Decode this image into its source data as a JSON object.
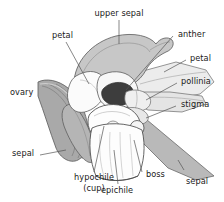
{
  "figure": {
    "kind": "botanical-diagram",
    "background_color": "#ffffff",
    "line_color": "#3a3a3a",
    "leader_line_color": "#555555",
    "text_color": "#1a1a1a",
    "fill_colors": {
      "upper_sepal": "#c9c9c9",
      "lateral_sepal": "#b8b8b8",
      "ovary": "#a8a8a8",
      "ovary_dark": "#949494",
      "petal_light": "#ececec",
      "column_white": "#fbfbfb",
      "anther_dark": "#3d3d3d",
      "lip_white": "#fdfdfd",
      "mid_gray": "#d4d4d4"
    }
  },
  "labels": {
    "upper_sepal": "upper sepal",
    "petal_left": "petal",
    "anther": "anther",
    "petal_right": "petal",
    "pollinia": "pollinia",
    "stigma": "stigma",
    "ovary": "ovary",
    "sepal_left": "sepal",
    "sepal_right": "sepal",
    "hypochile": "hypochile",
    "hypochile_cup": "(cup)",
    "epichile": "epichile",
    "boss": "boss"
  }
}
